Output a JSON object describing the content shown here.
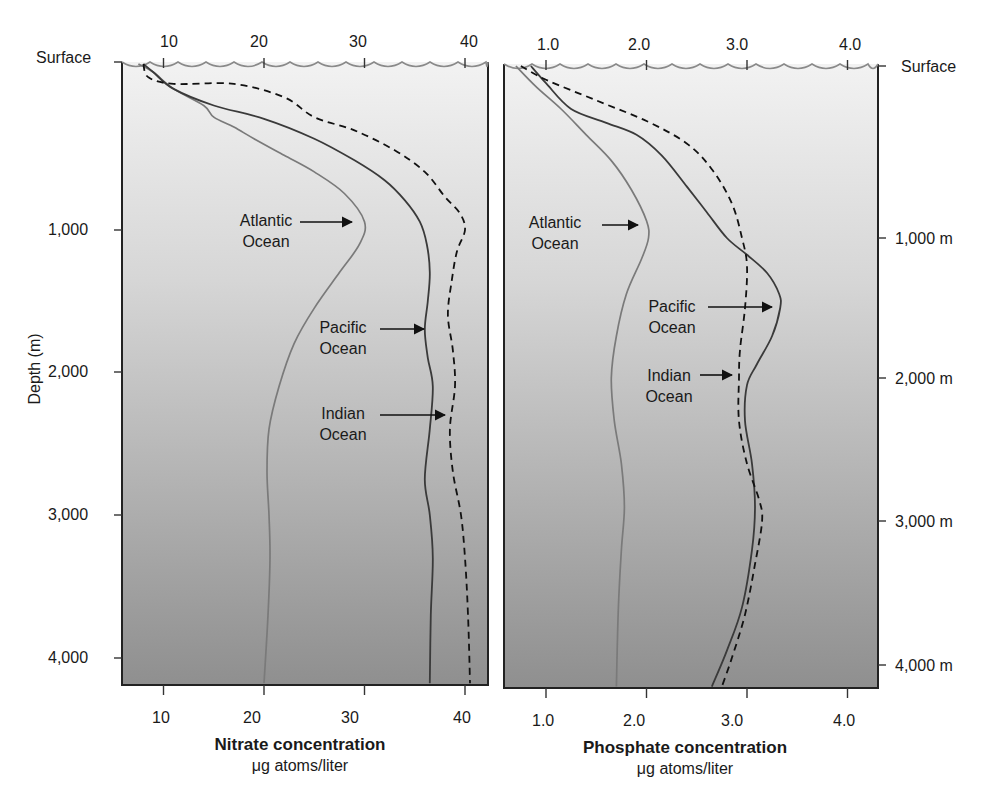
{
  "figure": {
    "colors": {
      "panel_top": "#f2f2f2",
      "panel_bottom": "#8f8f8f",
      "atlantic_line": "#7a7a7a",
      "pacific_line": "#3a3a3a",
      "indian_line": "#111111",
      "frame": "#222222",
      "wave": "#8a8a8a"
    },
    "y_axis_label": "Depth (m)",
    "left_depth_ticks": [
      "Surface",
      "1,000",
      "2,000",
      "3,000",
      "4,000"
    ],
    "right_depth_ticks": [
      "Surface",
      "1,000 m",
      "2,000 m",
      "3,000 m",
      "4,000 m"
    ],
    "nitrate": {
      "top_ticks": [
        "10",
        "20",
        "30",
        "40"
      ],
      "bottom_ticks": [
        "10",
        "20",
        "30",
        "40"
      ],
      "title": "Nitrate concentration",
      "unit": "μg atoms/liter",
      "labels": {
        "atlantic": [
          "Atlantic",
          "Ocean"
        ],
        "pacific": [
          "Pacific",
          "Ocean"
        ],
        "indian": [
          "Indian",
          "Ocean"
        ]
      }
    },
    "phosphate": {
      "top_ticks": [
        "1.0",
        "2.0",
        "3.0",
        "4.0"
      ],
      "bottom_ticks": [
        "1.0",
        "2.0",
        "3.0",
        "4.0"
      ],
      "title": "Phosphate concentration",
      "unit": "μg atoms/liter",
      "labels": {
        "atlantic": [
          "Atlantic",
          "Ocean"
        ],
        "pacific": [
          "Pacific",
          "Ocean"
        ],
        "indian": [
          "Indian",
          "Ocean"
        ]
      }
    }
  },
  "chart_data": [
    {
      "type": "line",
      "title": "Nitrate concentration",
      "xlabel": "Nitrate concentration (μg atoms/liter)",
      "ylabel": "Depth (m)",
      "xlim": [
        6,
        42
      ],
      "ylim": [
        4200,
        0
      ],
      "x_ticks": [
        10,
        20,
        30,
        40
      ],
      "y_ticks": [
        "Surface",
        1000,
        2000,
        3000,
        4000
      ],
      "y_inverted": true,
      "grid": false,
      "legend": "inline arrow labels",
      "series": [
        {
          "name": "Atlantic Ocean",
          "style": "solid-gray",
          "points": [
            [
              7.5,
              0
            ],
            [
              9,
              50
            ],
            [
              11,
              150
            ],
            [
              14,
              250
            ],
            [
              15,
              320
            ],
            [
              17,
              380
            ],
            [
              19,
              450
            ],
            [
              22,
              550
            ],
            [
              25,
              650
            ],
            [
              28,
              780
            ],
            [
              30,
              950
            ],
            [
              29.5,
              1100
            ],
            [
              27.5,
              1300
            ],
            [
              25,
              1550
            ],
            [
              23,
              1800
            ],
            [
              21.5,
              2100
            ],
            [
              20.5,
              2400
            ],
            [
              20.3,
              2700
            ],
            [
              20.5,
              3000
            ],
            [
              20.6,
              3300
            ],
            [
              20.4,
              3700
            ],
            [
              20,
              4180
            ]
          ]
        },
        {
          "name": "Pacific Ocean",
          "style": "solid-dark",
          "points": [
            [
              8,
              0
            ],
            [
              9,
              50
            ],
            [
              11,
              150
            ],
            [
              15,
              250
            ],
            [
              20,
              330
            ],
            [
              25,
              450
            ],
            [
              29,
              580
            ],
            [
              32,
              700
            ],
            [
              34,
              820
            ],
            [
              35.5,
              950
            ],
            [
              36.2,
              1100
            ],
            [
              36.5,
              1300
            ],
            [
              36.3,
              1500
            ],
            [
              36,
              1700
            ],
            [
              36.3,
              1900
            ],
            [
              36.8,
              2100
            ],
            [
              36.5,
              2400
            ],
            [
              36,
              2750
            ],
            [
              36.5,
              3000
            ],
            [
              36.8,
              3300
            ],
            [
              36.6,
              3700
            ],
            [
              36.5,
              4180
            ]
          ]
        },
        {
          "name": "Indian Ocean",
          "style": "dashed-black",
          "points": [
            [
              8,
              0
            ],
            [
              8.5,
              80
            ],
            [
              11,
              120
            ],
            [
              17,
              120
            ],
            [
              22,
              200
            ],
            [
              25,
              320
            ],
            [
              29,
              400
            ],
            [
              33,
              520
            ],
            [
              36,
              650
            ],
            [
              38,
              800
            ],
            [
              39.5,
              900
            ],
            [
              40,
              1000
            ],
            [
              39.2,
              1150
            ],
            [
              38.7,
              1350
            ],
            [
              38.3,
              1600
            ],
            [
              38.8,
              1850
            ],
            [
              39,
              2100
            ],
            [
              38.5,
              2400
            ],
            [
              38.8,
              2700
            ],
            [
              39.6,
              3000
            ],
            [
              40,
              3300
            ],
            [
              40.3,
              3700
            ],
            [
              40.5,
              4180
            ]
          ]
        }
      ],
      "annotations": [
        "Atlantic Ocean",
        "Pacific Ocean",
        "Indian Ocean"
      ]
    },
    {
      "type": "line",
      "title": "Phosphate concentration",
      "xlabel": "Phosphate concentration (μg atoms/liter)",
      "ylabel": "Depth (m)",
      "xlim": [
        0.6,
        4.3
      ],
      "ylim": [
        4200,
        0
      ],
      "x_ticks": [
        1.0,
        2.0,
        3.0,
        4.0
      ],
      "y_ticks": [
        "Surface",
        1000,
        2000,
        3000,
        4000
      ],
      "y_inverted": true,
      "grid": false,
      "legend": "inline arrow labels",
      "series": [
        {
          "name": "Atlantic Ocean",
          "style": "solid-gray",
          "points": [
            [
              0.7,
              0
            ],
            [
              0.9,
              120
            ],
            [
              1.15,
              250
            ],
            [
              1.4,
              400
            ],
            [
              1.65,
              550
            ],
            [
              1.85,
              720
            ],
            [
              2.0,
              900
            ],
            [
              2.02,
              1000
            ],
            [
              1.95,
              1150
            ],
            [
              1.8,
              1400
            ],
            [
              1.7,
              1700
            ],
            [
              1.65,
              2000
            ],
            [
              1.68,
              2300
            ],
            [
              1.75,
              2600
            ],
            [
              1.78,
              2900
            ],
            [
              1.75,
              3200
            ],
            [
              1.72,
              3600
            ],
            [
              1.7,
              4180
            ]
          ]
        },
        {
          "name": "Pacific Ocean",
          "style": "solid-dark",
          "points": [
            [
              0.85,
              0
            ],
            [
              1.0,
              100
            ],
            [
              1.25,
              250
            ],
            [
              1.6,
              330
            ],
            [
              1.9,
              400
            ],
            [
              2.15,
              520
            ],
            [
              2.4,
              700
            ],
            [
              2.6,
              850
            ],
            [
              2.8,
              1000
            ],
            [
              3.0,
              1120
            ],
            [
              3.2,
              1250
            ],
            [
              3.32,
              1400
            ],
            [
              3.33,
              1500
            ],
            [
              3.25,
              1700
            ],
            [
              3.1,
              1900
            ],
            [
              3.0,
              2050
            ],
            [
              2.98,
              2300
            ],
            [
              3.05,
              2600
            ],
            [
              3.08,
              2900
            ],
            [
              3.05,
              3200
            ],
            [
              2.95,
              3600
            ],
            [
              2.8,
              3900
            ],
            [
              2.65,
              4180
            ]
          ]
        },
        {
          "name": "Indian Ocean",
          "style": "dashed-black",
          "points": [
            [
              0.75,
              0
            ],
            [
              1.0,
              80
            ],
            [
              1.5,
              200
            ],
            [
              2.0,
              320
            ],
            [
              2.4,
              450
            ],
            [
              2.65,
              600
            ],
            [
              2.85,
              800
            ],
            [
              2.95,
              1000
            ],
            [
              3.0,
              1200
            ],
            [
              2.98,
              1500
            ],
            [
              2.93,
              1800
            ],
            [
              2.92,
              2000
            ],
            [
              2.92,
              2300
            ],
            [
              3.0,
              2600
            ],
            [
              3.12,
              2850
            ],
            [
              3.15,
              3000
            ],
            [
              3.08,
              3300
            ],
            [
              2.98,
              3650
            ],
            [
              2.85,
              3950
            ],
            [
              2.75,
              4180
            ]
          ]
        }
      ],
      "annotations": [
        "Atlantic Ocean",
        "Pacific Ocean",
        "Indian Ocean"
      ]
    }
  ]
}
